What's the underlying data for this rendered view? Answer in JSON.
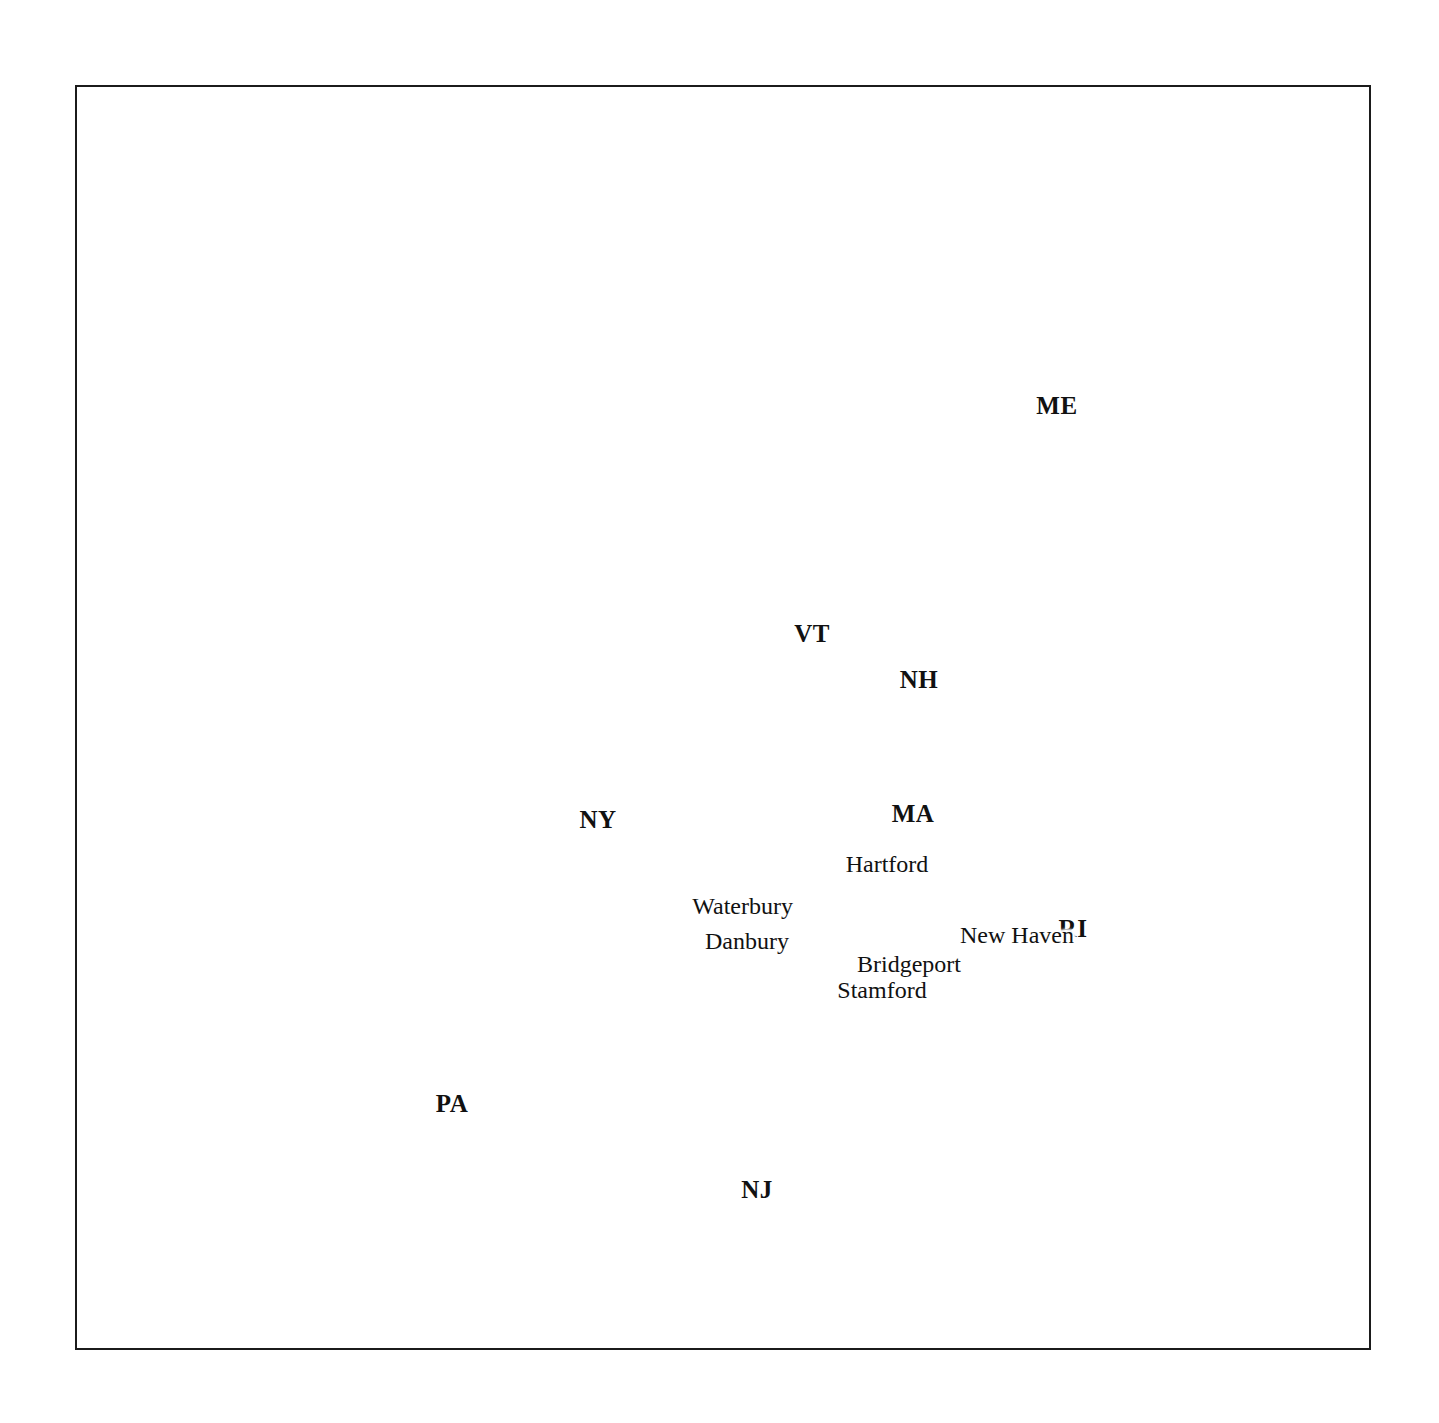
{
  "map": {
    "title": "Connecticut and surrounding Northeastern United States",
    "background_color": "#ffffff",
    "land_fill_color": "#d9d9d9",
    "highlight_fill_color": "#ffffff",
    "shadow_color": "#000000",
    "outline_color": "#1b1b1b",
    "frame": {
      "color": "#1b1b1b",
      "x": 75,
      "y": 85,
      "width": 1296,
      "height": 1265
    },
    "highlighted_state": "CT"
  },
  "state_labels": [
    {
      "code": "ME",
      "x": 1057,
      "y": 406
    },
    {
      "code": "VT",
      "x": 812,
      "y": 634
    },
    {
      "code": "NH",
      "x": 919,
      "y": 680
    },
    {
      "code": "NY",
      "x": 598,
      "y": 820
    },
    {
      "code": "MA",
      "x": 913,
      "y": 814
    },
    {
      "code": "RI",
      "x": 1073,
      "y": 929
    },
    {
      "code": "PA",
      "x": 452,
      "y": 1104
    },
    {
      "code": "NJ",
      "x": 757,
      "y": 1190
    }
  ],
  "cities": [
    {
      "name": "Hartford",
      "capital": true,
      "marker": "star-in-circle",
      "dot_x": 884,
      "dot_y": 886,
      "label_x": 887,
      "label_y": 864,
      "label_anchor": "center"
    },
    {
      "name": "Waterbury",
      "capital": false,
      "marker": "dot",
      "dot_x": 846,
      "dot_y": 907,
      "label_x": 793,
      "label_y": 906,
      "label_anchor": "right"
    },
    {
      "name": "Danbury",
      "capital": false,
      "marker": "dot",
      "dot_x": 836,
      "dot_y": 941,
      "label_x": 789,
      "label_y": 941,
      "label_anchor": "right"
    },
    {
      "name": "New Haven",
      "capital": false,
      "marker": "dot",
      "dot_x": 891,
      "dot_y": 933,
      "label_x": 960,
      "label_y": 935,
      "label_anchor": "left"
    },
    {
      "name": "Bridgeport",
      "capital": false,
      "marker": "dot",
      "dot_x": 860,
      "dot_y": 952,
      "label_x": 909,
      "label_y": 964,
      "label_anchor": "center"
    },
    {
      "name": "Stamford",
      "capital": false,
      "marker": "dot",
      "dot_x": 836,
      "dot_y": 978,
      "label_x": 882,
      "label_y": 990,
      "label_anchor": "center"
    }
  ],
  "leader_lines": [
    {
      "name": "ri-leader",
      "x1": 1040,
      "y1": 918,
      "x2": 985,
      "y2": 885
    }
  ]
}
